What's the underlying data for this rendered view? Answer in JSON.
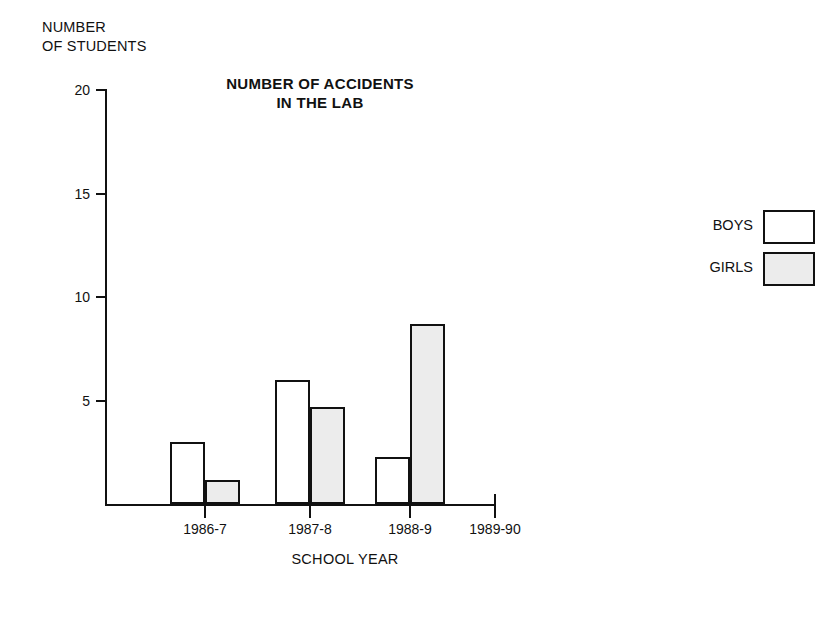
{
  "chart_data": {
    "type": "bar",
    "title_line1": "NUMBER OF ACCIDENTS",
    "title_line2": "IN THE LAB",
    "xlabel": "SCHOOL YEAR",
    "ylabel": "NUMBER\nOF STUDENTS",
    "ylabel_line1": "NUMBER",
    "ylabel_line2": "OF STUDENTS",
    "categories": [
      "1986-7",
      "1987-8",
      "1988-9",
      "1989-90"
    ],
    "series": [
      {
        "name": "BOYS",
        "color": "#ffffff",
        "values": [
          3,
          6,
          2.3,
          null
        ]
      },
      {
        "name": "GIRLS",
        "color": "#ececec",
        "values": [
          1.2,
          4.7,
          8.7,
          null
        ]
      }
    ],
    "ylim": [
      0,
      20
    ],
    "yticks": [
      5,
      10,
      15,
      20
    ],
    "ytick_labels": [
      "5",
      "10",
      "15",
      "20"
    ],
    "grid": false,
    "legend_position": "right",
    "legend": [
      {
        "label": "BOYS",
        "swatch": "white"
      },
      {
        "label": "GIRLS",
        "swatch": "gray"
      }
    ]
  },
  "colors": {
    "ink": "#111111",
    "boys_fill": "#ffffff",
    "girls_fill": "#ececec",
    "background": "#ffffff"
  }
}
